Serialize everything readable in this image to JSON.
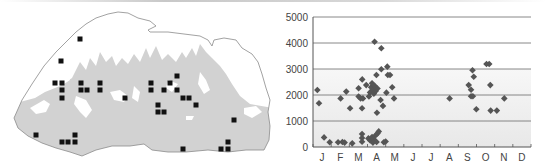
{
  "figure": {
    "map": {
      "description": "Country outline map with sampling locations",
      "marker": "square",
      "marker_color": "#111111",
      "fill_low": "#d0d0d0",
      "fill_high": "#ffffff",
      "outline_color": "#8a8a8a",
      "points": [
        [
          80,
          39
        ],
        [
          61,
          61
        ],
        [
          55,
          83
        ],
        [
          62,
          83
        ],
        [
          81,
          83
        ],
        [
          100,
          83
        ],
        [
          62,
          90
        ],
        [
          81,
          90
        ],
        [
          87,
          90
        ],
        [
          100,
          90
        ],
        [
          62,
          98
        ],
        [
          125,
          98
        ],
        [
          151,
          83
        ],
        [
          170,
          83
        ],
        [
          177,
          76
        ],
        [
          151,
          90
        ],
        [
          164,
          90
        ],
        [
          177,
          90
        ],
        [
          183,
          98
        ],
        [
          189,
          98
        ],
        [
          196,
          105
        ],
        [
          158,
          105
        ],
        [
          158,
          112
        ],
        [
          164,
          112
        ],
        [
          234,
          120
        ],
        [
          36,
          135
        ],
        [
          75,
          135
        ],
        [
          62,
          142
        ],
        [
          68,
          142
        ],
        [
          75,
          142
        ],
        [
          183,
          149
        ],
        [
          228,
          142
        ],
        [
          221,
          149
        ],
        [
          228,
          149
        ]
      ]
    }
  },
  "chart_data": {
    "type": "scatter",
    "title": "",
    "xlabel": "",
    "ylabel": "",
    "categories": [
      "J",
      "F",
      "M",
      "A",
      "M",
      "J",
      "J",
      "A",
      "S",
      "O",
      "N",
      "D"
    ],
    "yticks": [
      0,
      1000,
      2000,
      3000,
      4000,
      5000
    ],
    "ytick_labels": [
      "0",
      "1000",
      "2000",
      "3000",
      "4000",
      "5000"
    ],
    "ylim": [
      0,
      5000
    ],
    "xlim": [
      0,
      12
    ],
    "grid": "horizontal",
    "marker": "diamond",
    "marker_color": "#555555",
    "shaded_band": {
      "from": 0,
      "to": 3000,
      "color": "#efefef"
    },
    "series": [
      {
        "name": "records",
        "points": [
          [
            0.24,
            2190
          ],
          [
            0.33,
            1680
          ],
          [
            0.61,
            370
          ],
          [
            0.92,
            180
          ],
          [
            1.38,
            180
          ],
          [
            1.52,
            1870
          ],
          [
            1.62,
            190
          ],
          [
            1.74,
            170
          ],
          [
            1.83,
            2130
          ],
          [
            2.04,
            1490
          ],
          [
            2.16,
            140
          ],
          [
            2.51,
            2260
          ],
          [
            2.51,
            1940
          ],
          [
            2.62,
            1870
          ],
          [
            2.7,
            1490
          ],
          [
            2.71,
            2600
          ],
          [
            2.75,
            1870
          ],
          [
            2.7,
            500
          ],
          [
            2.7,
            350
          ],
          [
            2.7,
            200
          ],
          [
            2.93,
            2380
          ],
          [
            3.08,
            1940
          ],
          [
            3.14,
            2100
          ],
          [
            3.2,
            2300
          ],
          [
            3.25,
            2450
          ],
          [
            3.3,
            2200
          ],
          [
            3.35,
            2050
          ],
          [
            3.39,
            4050
          ],
          [
            3.4,
            2350
          ],
          [
            3.45,
            2150
          ],
          [
            3.49,
            2770
          ],
          [
            3.52,
            1320
          ],
          [
            3.55,
            2250
          ],
          [
            3.76,
            3800
          ],
          [
            3.76,
            2990
          ],
          [
            3.72,
            1810
          ],
          [
            3.85,
            1580
          ],
          [
            3.05,
            330
          ],
          [
            3.15,
            250
          ],
          [
            3.25,
            380
          ],
          [
            3.35,
            300
          ],
          [
            3.45,
            450
          ],
          [
            3.55,
            520
          ],
          [
            3.62,
            600
          ],
          [
            3.3,
            170
          ],
          [
            3.5,
            190
          ],
          [
            3.9,
            180
          ],
          [
            4.0,
            210
          ],
          [
            4.04,
            2090
          ],
          [
            4.09,
            3090
          ],
          [
            4.12,
            2770
          ],
          [
            4.24,
            2770
          ],
          [
            4.36,
            2300
          ],
          [
            4.46,
            1870
          ],
          [
            7.52,
            1870
          ],
          [
            8.57,
            2380
          ],
          [
            8.7,
            2200
          ],
          [
            8.7,
            1950
          ],
          [
            8.78,
            2950
          ],
          [
            8.85,
            2700
          ],
          [
            8.8,
            1950
          ],
          [
            8.99,
            1450
          ],
          [
            9.55,
            3190
          ],
          [
            9.7,
            3190
          ],
          [
            9.76,
            2380
          ],
          [
            9.78,
            1400
          ],
          [
            10.12,
            1400
          ],
          [
            10.53,
            1870
          ]
        ]
      }
    ]
  }
}
